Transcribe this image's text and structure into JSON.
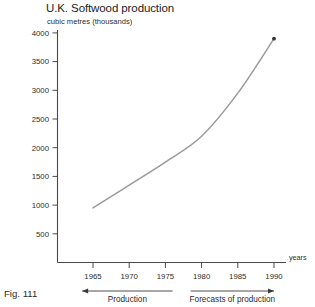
{
  "figure": {
    "caption": "Fig. 111"
  },
  "chart_data": {
    "type": "line",
    "title": "U.K. Softwood production",
    "subtitle": "cubic metres (thousands)",
    "xlabel": "years",
    "ylabel": "cubic metres (thousands)",
    "xlim": [
      1963,
      1991
    ],
    "ylim": [
      0,
      4200
    ],
    "grid": false,
    "legend_position": "none",
    "x_ticks": [
      "1965",
      "1970",
      "1975",
      "1980",
      "1985",
      "1990"
    ],
    "x_tick_values": [
      1965,
      1970,
      1975,
      1980,
      1985,
      1990
    ],
    "y_ticks": [
      "500",
      "1000",
      "1500",
      "2000",
      "2500",
      "3000",
      "3500",
      "4000"
    ],
    "y_tick_values": [
      500,
      1000,
      1500,
      2000,
      2500,
      3000,
      3500,
      4000
    ],
    "series": [
      {
        "name": "U.K. Softwood production",
        "x": [
          1965,
          1970,
          1975,
          1980,
          1985,
          1990
        ],
        "values": [
          950,
          1350,
          1750,
          2200,
          2950,
          3900
        ],
        "color": "#9a9a9a",
        "end_marker": true
      }
    ],
    "annotations": [
      {
        "name": "production-span",
        "label": "Production",
        "x_from": 1963.5,
        "x_to": 1976,
        "arrow": "left"
      },
      {
        "name": "forecasts-span",
        "label": "Forecasts of production",
        "x_from": 1978.5,
        "x_to": 1990,
        "arrow": "right"
      }
    ]
  }
}
